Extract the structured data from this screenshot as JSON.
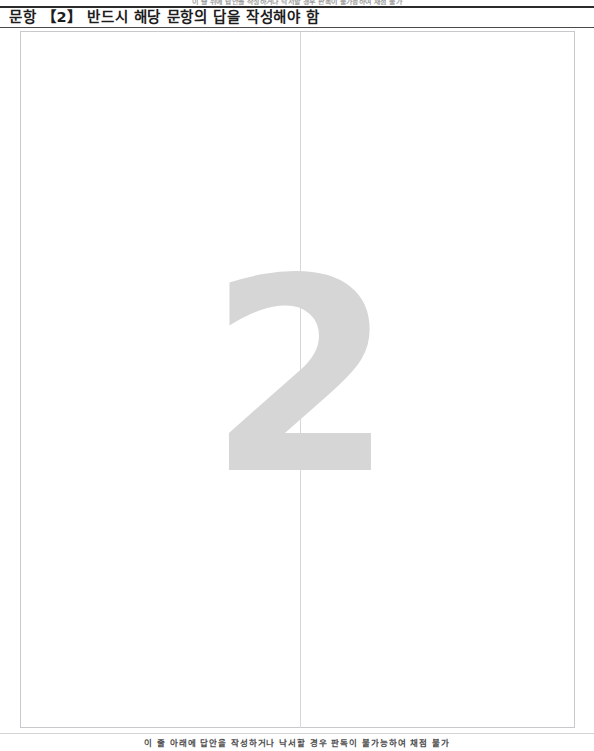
{
  "page": {
    "background_color": "#ffffff",
    "width": 594,
    "height": 751
  },
  "top_notice": {
    "text": "이 줄 위에 답안을 작성하거나 낙서할 경우 판독이 불가능하여 채점 불가"
  },
  "header": {
    "label": "문항 【2】 반드시 해당 문항의 답을 작성해야 함",
    "rule_color": "#2b2b2b"
  },
  "answer_area": {
    "watermark_number": "2",
    "watermark_color": "#d6d6d6",
    "border_color": "#c9c9cd",
    "divider_color": "#d8d8dc"
  },
  "footer": {
    "notice": "이 줄 아래에 답안을 작성하거나 낙서할 경우 판독이 불가능하여 채점 불가",
    "rule_color": "#d5d5d8"
  }
}
